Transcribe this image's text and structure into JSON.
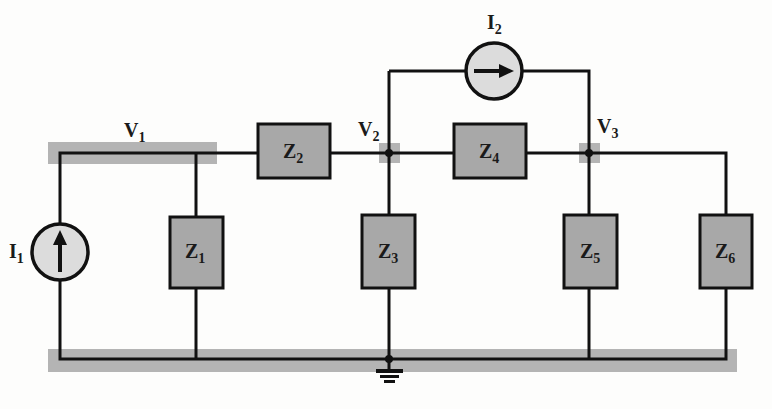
{
  "diagram": {
    "type": "circuit-schematic",
    "colors": {
      "wire": "#111111",
      "node_highlight": "#b4b4b4",
      "impedance_fill": "#a8a8a8",
      "source_fill": "#dcdcdc",
      "background": "#fdfdfc"
    },
    "nodes": [
      {
        "id": "V1",
        "label": "V",
        "sub": "1"
      },
      {
        "id": "V2",
        "label": "V",
        "sub": "2"
      },
      {
        "id": "V3",
        "label": "V",
        "sub": "3"
      },
      {
        "id": "GND",
        "label": "ground"
      }
    ],
    "sources": [
      {
        "id": "I1",
        "label": "I",
        "sub": "1",
        "direction": "up",
        "between": [
          "GND",
          "V1"
        ]
      },
      {
        "id": "I2",
        "label": "I",
        "sub": "2",
        "direction": "right",
        "between": [
          "V2",
          "V3"
        ]
      }
    ],
    "impedances": [
      {
        "id": "Z1",
        "label": "Z",
        "sub": "1",
        "between": [
          "V1",
          "GND"
        ]
      },
      {
        "id": "Z2",
        "label": "Z",
        "sub": "2",
        "between": [
          "V1",
          "V2"
        ]
      },
      {
        "id": "Z3",
        "label": "Z",
        "sub": "3",
        "between": [
          "V2",
          "GND"
        ]
      },
      {
        "id": "Z4",
        "label": "Z",
        "sub": "4",
        "between": [
          "V2",
          "V3"
        ]
      },
      {
        "id": "Z5",
        "label": "Z",
        "sub": "5",
        "between": [
          "V3",
          "GND"
        ]
      },
      {
        "id": "Z6",
        "label": "Z",
        "sub": "6",
        "between": [
          "V3",
          "GND"
        ]
      }
    ]
  }
}
